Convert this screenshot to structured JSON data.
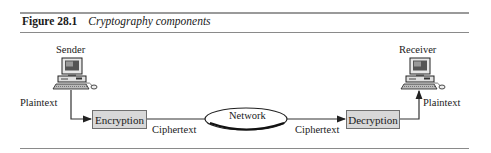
{
  "figure": {
    "number": "Figure 28.1",
    "title": "Cryptography components"
  },
  "nodes": {
    "sender": {
      "label": "Sender",
      "icon": "computer-icon"
    },
    "receiver": {
      "label": "Receiver",
      "icon": "computer-icon"
    },
    "encryption": {
      "label": "Encryption"
    },
    "network": {
      "label": "Network"
    },
    "decryption": {
      "label": "Decryption"
    }
  },
  "edges": {
    "sender_to_encryption": "Plaintext",
    "encryption_to_network": "Ciphertext",
    "network_to_decryption": "Ciphertext",
    "decryption_to_receiver": "Plaintext"
  },
  "colors": {
    "box_fill": "#d8d8d8",
    "line": "#333333",
    "rule": "#8a8a8a"
  }
}
